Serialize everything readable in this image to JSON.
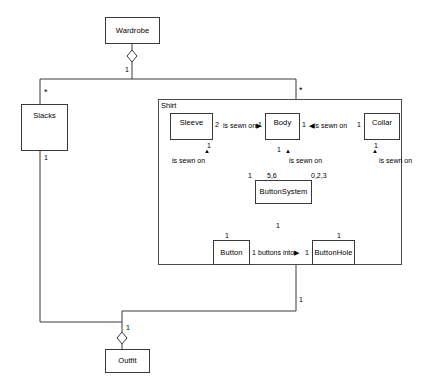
{
  "diagram": {
    "package": {
      "name": "Shirt"
    },
    "classes": {
      "wardrobe": "Wardrobe",
      "slacks": "Slacks",
      "outfit": "Outfit",
      "sleeve": "Sleeve",
      "body": "Body",
      "collar": "Collar",
      "button_system": "ButtonSystem",
      "button": "Button",
      "button_hole": "ButtonHole"
    },
    "associations": {
      "sleeve_body": {
        "label": "is sewn on",
        "arrow": "▶",
        "source_mult": "2",
        "target_mult": "1"
      },
      "body_collar": {
        "label": "is sewn on",
        "arrow": "◀",
        "source_mult": "1",
        "target_mult": "1"
      },
      "button_buttonhole": {
        "label": "buttons into",
        "arrow": "▶",
        "source_mult": "1",
        "target_mult": "1"
      },
      "sleeve_buttonsystem": {
        "label": "is sewn on",
        "marker": "▲",
        "sleeve_mult": "1",
        "system_mult": "1"
      },
      "body_buttonsystem": {
        "label": "is sewn on",
        "marker": "▲",
        "body_mult": "1",
        "system_mult": "5,6"
      },
      "collar_buttonsystem": {
        "label": "is sewn on",
        "marker": "▲",
        "collar_mult": "1",
        "system_mult": "0,2,3"
      }
    },
    "multiplicities": {
      "wardrobe_end": "1",
      "slacks_top": "*",
      "shirt_top": "*",
      "slacks_bottom": "1",
      "shirt_bottom": "1",
      "outfit_end": "1",
      "buttonsystem_composition": "1",
      "button_top": "1",
      "buttonhole_top": "1"
    },
    "colors": {
      "stroke": "#3a3a3a",
      "fill": "#ffffff",
      "text": "#000000"
    }
  }
}
